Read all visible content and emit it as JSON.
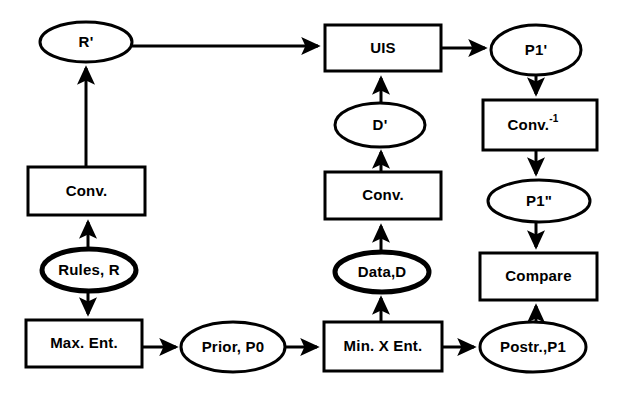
{
  "diagram": {
    "background_color": "#ffffff",
    "stroke_color": "#000000",
    "nodes": [
      {
        "id": "r_prime",
        "label": "R'",
        "shape": "ellipse",
        "cx": 86,
        "cy": 42,
        "rx": 46,
        "ry": 20,
        "thick": false
      },
      {
        "id": "uis",
        "label": "UIS",
        "shape": "rectangle",
        "x": 325,
        "y": 25,
        "w": 116,
        "h": 46
      },
      {
        "id": "p1_prime",
        "label": "P1'",
        "shape": "ellipse",
        "cx": 536,
        "cy": 50,
        "rx": 45,
        "ry": 25,
        "thick": false
      },
      {
        "id": "d_prime",
        "label": "D'",
        "shape": "ellipse",
        "cx": 380,
        "cy": 125,
        "rx": 45,
        "ry": 22,
        "thick": false
      },
      {
        "id": "conv_inv",
        "label": "Conv.",
        "sup": "-1",
        "shape": "rectangle",
        "x": 483,
        "y": 100,
        "w": 114,
        "h": 50
      },
      {
        "id": "conv_left",
        "label": "Conv.",
        "shape": "rectangle",
        "x": 28,
        "y": 167,
        "w": 117,
        "h": 48
      },
      {
        "id": "conv_mid",
        "label": "Conv.",
        "shape": "rectangle",
        "x": 325,
        "y": 172,
        "w": 116,
        "h": 47
      },
      {
        "id": "p1_dprime",
        "label": "P1\"",
        "shape": "ellipse",
        "cx": 539,
        "cy": 201,
        "rx": 51,
        "ry": 21,
        "thick": false
      },
      {
        "id": "rules_r",
        "label": "Rules, R",
        "shape": "ellipse",
        "cx": 89,
        "cy": 270,
        "rx": 47,
        "ry": 21,
        "thick": true
      },
      {
        "id": "data_d",
        "label": "Data,D",
        "shape": "ellipse",
        "cx": 382,
        "cy": 272,
        "rx": 47,
        "ry": 20,
        "thick": true
      },
      {
        "id": "compare",
        "label": "Compare",
        "shape": "rectangle",
        "x": 480,
        "y": 253,
        "w": 117,
        "h": 47
      },
      {
        "id": "max_ent",
        "label": "Max. Ent.",
        "shape": "rectangle",
        "x": 26,
        "y": 320,
        "w": 116,
        "h": 47
      },
      {
        "id": "prior_p0",
        "label": "Prior,  P0",
        "shape": "ellipse",
        "cx": 233,
        "cy": 347,
        "rx": 52,
        "ry": 25,
        "thick": false
      },
      {
        "id": "min_x_ent",
        "label": "Min. X Ent.",
        "shape": "rectangle",
        "x": 324,
        "y": 322,
        "w": 118,
        "h": 49
      },
      {
        "id": "postr_p1",
        "label": "Postr.,P1",
        "shape": "ellipse",
        "cx": 533,
        "cy": 347,
        "rx": 53,
        "ry": 25,
        "thick": false
      }
    ],
    "edges": [
      {
        "id": "e-rprime-uis",
        "from": "r_prime",
        "to": "uis",
        "path": "M 132 46 L 318 46",
        "arrow": true
      },
      {
        "id": "e-uis-p1prime",
        "from": "uis",
        "to": "p1_prime",
        "path": "M 441 48 L 485 48",
        "arrow": true
      },
      {
        "id": "e-convleft-rprime",
        "from": "conv_left",
        "to": "r_prime",
        "path": "M 86 167 L 86 68",
        "arrow": true
      },
      {
        "id": "e-rulesr-convleft",
        "from": "rules_r",
        "to": "conv_left",
        "path": "M 88 251 L 88 222",
        "arrow": true
      },
      {
        "id": "e-rulesr-maxent",
        "from": "rules_r",
        "to": "max_ent",
        "path": "M 88 289 L 88 314",
        "arrow": true
      },
      {
        "id": "e-maxent-priorp0",
        "from": "max_ent",
        "to": "prior_p0",
        "path": "M 142 347 L 176 347",
        "arrow": true
      },
      {
        "id": "e-priorp0-minxent",
        "from": "prior_p0",
        "to": "min_x_ent",
        "path": "M 285 347 L 317 347",
        "arrow": true
      },
      {
        "id": "e-minxent-postrp1",
        "from": "min_x_ent",
        "to": "postr_p1",
        "path": "M 442 347 L 474 347",
        "arrow": true
      },
      {
        "id": "e-datad-convmid",
        "from": "data_d",
        "to": "conv_mid",
        "path": "M 381 253 L 381 226",
        "arrow": true
      },
      {
        "id": "e-minxent-datad",
        "from": "min_x_ent",
        "to": "data_d",
        "path": "M 381 322 L 381 298",
        "arrow": true
      },
      {
        "id": "e-convmid-dprime",
        "from": "conv_mid",
        "to": "d_prime",
        "path": "M 381 172 L 381 152",
        "arrow": true
      },
      {
        "id": "e-dprime-uis",
        "from": "d_prime",
        "to": "uis",
        "path": "M 381 103 L 381 78",
        "arrow": true
      },
      {
        "id": "e-p1prime-convinv",
        "from": "p1_prime",
        "to": "conv_inv",
        "path": "M 536 74 L 536 94",
        "arrow": true
      },
      {
        "id": "e-convinv-p1dprime",
        "from": "conv_inv",
        "to": "p1_dprime",
        "path": "M 536 150 L 536 174",
        "arrow": true
      },
      {
        "id": "e-p1dprime-compare",
        "from": "p1_dprime",
        "to": "compare",
        "path": "M 536 222 L 536 247",
        "arrow": true
      },
      {
        "id": "e-postrp1-compare",
        "from": "postr_p1",
        "to": "compare",
        "path": "M 536 322 L 536 306",
        "arrow": true
      }
    ]
  }
}
